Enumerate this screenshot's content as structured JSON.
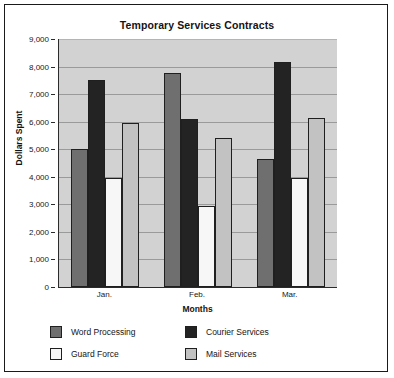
{
  "chart_data": {
    "type": "bar",
    "title": "Temporary Services Contracts",
    "xlabel": "Months",
    "ylabel": "Dollars Spent",
    "categories": [
      "Jan.",
      "Feb.",
      "Mar."
    ],
    "ylim": [
      0,
      9000
    ],
    "ytick_labels": [
      "0",
      "1,000",
      "2,000",
      "3,000",
      "4,000",
      "5,000",
      "6,000",
      "7,000",
      "8,000",
      "9,000"
    ],
    "ytick_values": [
      0,
      1000,
      2000,
      3000,
      4000,
      5000,
      6000,
      7000,
      8000,
      9000
    ],
    "grid": true,
    "legend_position": "bottom-left",
    "series": [
      {
        "name": "Word Processing",
        "color": "#6f6f6f",
        "values": [
          5000,
          7750,
          4650
        ]
      },
      {
        "name": "Courier Services",
        "color": "#232323",
        "values": [
          7500,
          6100,
          8150
        ]
      },
      {
        "name": "Guard Force",
        "color": "#f7f7f7",
        "values": [
          3950,
          2950,
          3950
        ]
      },
      {
        "name": "Mail Services",
        "color": "#c2c2c2",
        "values": [
          5950,
          5400,
          6150
        ]
      }
    ],
    "plot_background": "#d2d2d2",
    "axis_color": "#2b2b2b",
    "gridline_color": "#9a9a9a"
  }
}
